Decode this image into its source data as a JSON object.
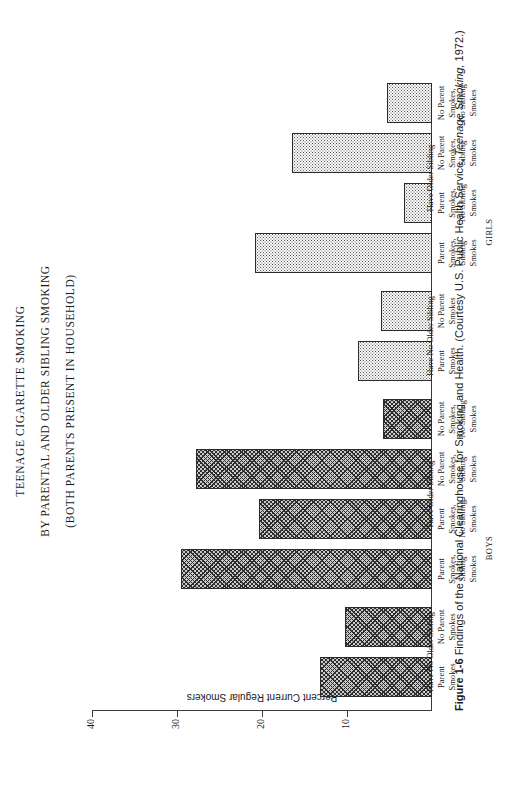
{
  "titles": {
    "line1": "TEENAGE CIGARETTE SMOKING",
    "line2": "BY PARENTAL AND OLDER SIBLING SMOKING",
    "line3": "(BOTH PARENTS PRESENT IN HOUSEHOLD)"
  },
  "axis": {
    "y_title": "Percent Current Regular Smokers",
    "ticks": [
      "40",
      "30",
      "20",
      "10"
    ]
  },
  "groups": {
    "boys": "BOYS",
    "girls": "GIRLS",
    "have_older_sibling": "Have Older Sibling",
    "have_no_older_sibling": "Have No Older Sibling"
  },
  "categories": [
    "Parent\nSmokes",
    "No Parent\nSmokes",
    "Parent\nSmokes,\nSibling\nSmokes",
    "Parent\nSmokes,\nNo Sibling\nSmokes",
    "No Parent\nSmokes,\nSibling\nSmokes",
    "No Parent\nSmokes,\nNo Sibling\nSmokes"
  ],
  "caption": {
    "figure_number": "Figure 1-6",
    "text": " Findings of the National Clearinghouse for Smoking and Health. (Courtesy U.S. Public Health Service, ",
    "italic": "Teenage Smoking,",
    "tail": " 1972.)"
  },
  "chart_data": {
    "type": "bar",
    "title": "TEENAGE CIGARETTE SMOKING BY PARENTAL AND OLDER SIBLING SMOKING (BOTH PARENTS PRESENT IN HOUSEHOLD)",
    "xlabel": "",
    "ylabel": "Percent Current Regular Smokers",
    "ylim": [
      0,
      40
    ],
    "yticks": [
      10,
      20,
      30,
      40
    ],
    "grid": false,
    "legend": "none",
    "orientation": "vertical",
    "categories": [
      "Have No Older Sibling / Parent Smokes",
      "Have No Older Sibling / No Parent Smokes",
      "Have Older Sibling / Parent Smokes, Sibling Smokes",
      "Have Older Sibling / Parent Smokes, No Sibling Smokes",
      "Have Older Sibling / No Parent Smokes, Sibling Smokes",
      "Have Older Sibling / No Parent Smokes, No Sibling Smokes"
    ],
    "series": [
      {
        "name": "BOYS",
        "values": [
          13.2,
          10.3,
          29.5,
          20.3,
          27.8,
          5.8
        ]
      },
      {
        "name": "GIRLS",
        "values": [
          8.7,
          6.0,
          20.8,
          3.3,
          16.5,
          5.3
        ]
      }
    ]
  }
}
